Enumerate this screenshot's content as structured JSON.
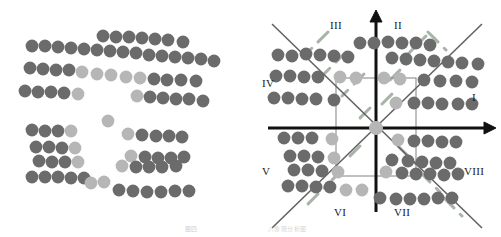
{
  "figure": {
    "title_caption": "图四",
    "subtitle_caption": "八象限分析图",
    "dot_colors": {
      "dark": "#6b6b6b",
      "light": "#b6b6b6"
    },
    "line_colors": {
      "axis": "#111111",
      "diagonal": "#6b6b6b",
      "dashed": "#9aa89a",
      "box": "#808080"
    }
  },
  "panels": [
    {
      "name": "left-scatter",
      "label": "Unlabeled dot cluster scatter",
      "dots": [
        {
          "x": 32,
          "y": 46,
          "c": "dark"
        },
        {
          "x": 45,
          "y": 46,
          "c": "dark"
        },
        {
          "x": 58,
          "y": 47,
          "c": "dark"
        },
        {
          "x": 71,
          "y": 48,
          "c": "dark"
        },
        {
          "x": 84,
          "y": 49,
          "c": "dark"
        },
        {
          "x": 97,
          "y": 50,
          "c": "dark"
        },
        {
          "x": 110,
          "y": 51,
          "c": "dark"
        },
        {
          "x": 123,
          "y": 52,
          "c": "dark"
        },
        {
          "x": 103,
          "y": 36,
          "c": "dark"
        },
        {
          "x": 116,
          "y": 37,
          "c": "dark"
        },
        {
          "x": 129,
          "y": 37,
          "c": "dark"
        },
        {
          "x": 142,
          "y": 38,
          "c": "dark"
        },
        {
          "x": 155,
          "y": 39,
          "c": "dark"
        },
        {
          "x": 168,
          "y": 40,
          "c": "dark"
        },
        {
          "x": 183,
          "y": 42,
          "c": "dark"
        },
        {
          "x": 136,
          "y": 53,
          "c": "dark"
        },
        {
          "x": 149,
          "y": 55,
          "c": "dark"
        },
        {
          "x": 162,
          "y": 56,
          "c": "dark"
        },
        {
          "x": 175,
          "y": 57,
          "c": "dark"
        },
        {
          "x": 188,
          "y": 58,
          "c": "dark"
        },
        {
          "x": 201,
          "y": 59,
          "c": "dark"
        },
        {
          "x": 214,
          "y": 61,
          "c": "dark"
        },
        {
          "x": 30,
          "y": 68,
          "c": "dark"
        },
        {
          "x": 43,
          "y": 69,
          "c": "dark"
        },
        {
          "x": 56,
          "y": 70,
          "c": "dark"
        },
        {
          "x": 69,
          "y": 70,
          "c": "dark"
        },
        {
          "x": 82,
          "y": 72,
          "c": "light"
        },
        {
          "x": 97,
          "y": 74,
          "c": "light"
        },
        {
          "x": 111,
          "y": 75,
          "c": "light"
        },
        {
          "x": 126,
          "y": 77,
          "c": "light"
        },
        {
          "x": 140,
          "y": 78,
          "c": "light"
        },
        {
          "x": 154,
          "y": 79,
          "c": "dark"
        },
        {
          "x": 167,
          "y": 80,
          "c": "dark"
        },
        {
          "x": 181,
          "y": 80,
          "c": "dark"
        },
        {
          "x": 196,
          "y": 81,
          "c": "dark"
        },
        {
          "x": 25,
          "y": 91,
          "c": "dark"
        },
        {
          "x": 38,
          "y": 92,
          "c": "dark"
        },
        {
          "x": 51,
          "y": 92,
          "c": "dark"
        },
        {
          "x": 64,
          "y": 93,
          "c": "dark"
        },
        {
          "x": 78,
          "y": 94,
          "c": "light"
        },
        {
          "x": 137,
          "y": 96,
          "c": "light"
        },
        {
          "x": 150,
          "y": 97,
          "c": "dark"
        },
        {
          "x": 163,
          "y": 98,
          "c": "dark"
        },
        {
          "x": 176,
          "y": 99,
          "c": "dark"
        },
        {
          "x": 189,
          "y": 99,
          "c": "dark"
        },
        {
          "x": 203,
          "y": 101,
          "c": "dark"
        },
        {
          "x": 108,
          "y": 121,
          "c": "light"
        },
        {
          "x": 32,
          "y": 130,
          "c": "dark"
        },
        {
          "x": 45,
          "y": 131,
          "c": "dark"
        },
        {
          "x": 58,
          "y": 131,
          "c": "dark"
        },
        {
          "x": 71,
          "y": 131,
          "c": "light"
        },
        {
          "x": 36,
          "y": 147,
          "c": "dark"
        },
        {
          "x": 49,
          "y": 147,
          "c": "dark"
        },
        {
          "x": 62,
          "y": 148,
          "c": "dark"
        },
        {
          "x": 75,
          "y": 148,
          "c": "light"
        },
        {
          "x": 128,
          "y": 134,
          "c": "light"
        },
        {
          "x": 142,
          "y": 135,
          "c": "dark"
        },
        {
          "x": 156,
          "y": 136,
          "c": "dark"
        },
        {
          "x": 169,
          "y": 136,
          "c": "dark"
        },
        {
          "x": 182,
          "y": 137,
          "c": "dark"
        },
        {
          "x": 39,
          "y": 161,
          "c": "dark"
        },
        {
          "x": 52,
          "y": 162,
          "c": "dark"
        },
        {
          "x": 65,
          "y": 162,
          "c": "dark"
        },
        {
          "x": 78,
          "y": 162,
          "c": "light"
        },
        {
          "x": 131,
          "y": 156,
          "c": "light"
        },
        {
          "x": 145,
          "y": 157,
          "c": "dark"
        },
        {
          "x": 158,
          "y": 158,
          "c": "dark"
        },
        {
          "x": 171,
          "y": 158,
          "c": "dark"
        },
        {
          "x": 184,
          "y": 157,
          "c": "dark"
        },
        {
          "x": 122,
          "y": 166,
          "c": "light"
        },
        {
          "x": 136,
          "y": 167,
          "c": "dark"
        },
        {
          "x": 149,
          "y": 167,
          "c": "dark"
        },
        {
          "x": 162,
          "y": 167,
          "c": "dark"
        },
        {
          "x": 176,
          "y": 166,
          "c": "dark"
        },
        {
          "x": 32,
          "y": 177,
          "c": "dark"
        },
        {
          "x": 45,
          "y": 177,
          "c": "dark"
        },
        {
          "x": 58,
          "y": 177,
          "c": "dark"
        },
        {
          "x": 71,
          "y": 178,
          "c": "dark"
        },
        {
          "x": 84,
          "y": 178,
          "c": "dark"
        },
        {
          "x": 91,
          "y": 183,
          "c": "light"
        },
        {
          "x": 104,
          "y": 182,
          "c": "light"
        },
        {
          "x": 119,
          "y": 190,
          "c": "dark"
        },
        {
          "x": 133,
          "y": 191,
          "c": "dark"
        },
        {
          "x": 147,
          "y": 192,
          "c": "dark"
        },
        {
          "x": 161,
          "y": 192,
          "c": "dark"
        },
        {
          "x": 175,
          "y": 191,
          "c": "dark"
        },
        {
          "x": 189,
          "y": 191,
          "c": "dark"
        }
      ]
    },
    {
      "name": "right-octant-diagram",
      "label": "Eight-octant partitioned scatter diagram",
      "axes": {
        "x_axis": {
          "from": [
            18,
            128
          ],
          "to": [
            238,
            128
          ]
        },
        "y_axis": {
          "from": [
            126,
            212
          ],
          "to": [
            126,
            16
          ]
        }
      },
      "quadrant_labels": [
        {
          "id": "I",
          "text": "I",
          "x": 222,
          "y": 92
        },
        {
          "id": "II",
          "text": "II",
          "x": 144,
          "y": 20
        },
        {
          "id": "III",
          "text": "III",
          "x": 80,
          "y": 20
        },
        {
          "id": "IV",
          "text": "IV",
          "x": 12,
          "y": 78
        },
        {
          "id": "V",
          "text": "V",
          "x": 12,
          "y": 166
        },
        {
          "id": "VI",
          "text": "VI",
          "x": 84,
          "y": 207
        },
        {
          "id": "VII",
          "text": "VII",
          "x": 144,
          "y": 207
        },
        {
          "id": "VIII",
          "text": "VIII",
          "x": 214,
          "y": 166
        }
      ],
      "dots": [
        {
          "x": 28,
          "y": 55,
          "c": "dark"
        },
        {
          "x": 42,
          "y": 56,
          "c": "dark"
        },
        {
          "x": 56,
          "y": 54,
          "c": "dark"
        },
        {
          "x": 70,
          "y": 55,
          "c": "dark"
        },
        {
          "x": 84,
          "y": 56,
          "c": "dark"
        },
        {
          "x": 98,
          "y": 57,
          "c": "dark"
        },
        {
          "x": 110,
          "y": 43,
          "c": "dark"
        },
        {
          "x": 124,
          "y": 43,
          "c": "dark"
        },
        {
          "x": 138,
          "y": 42,
          "c": "dark"
        },
        {
          "x": 152,
          "y": 43,
          "c": "dark"
        },
        {
          "x": 166,
          "y": 43,
          "c": "dark"
        },
        {
          "x": 180,
          "y": 45,
          "c": "dark"
        },
        {
          "x": 142,
          "y": 58,
          "c": "dark"
        },
        {
          "x": 156,
          "y": 59,
          "c": "dark"
        },
        {
          "x": 170,
          "y": 60,
          "c": "dark"
        },
        {
          "x": 184,
          "y": 61,
          "c": "dark"
        },
        {
          "x": 198,
          "y": 62,
          "c": "dark"
        },
        {
          "x": 212,
          "y": 63,
          "c": "dark"
        },
        {
          "x": 228,
          "y": 64,
          "c": "dark"
        },
        {
          "x": 26,
          "y": 76,
          "c": "dark"
        },
        {
          "x": 40,
          "y": 76,
          "c": "dark"
        },
        {
          "x": 54,
          "y": 77,
          "c": "dark"
        },
        {
          "x": 68,
          "y": 77,
          "c": "dark"
        },
        {
          "x": 90,
          "y": 77,
          "c": "light"
        },
        {
          "x": 106,
          "y": 78,
          "c": "light"
        },
        {
          "x": 134,
          "y": 78,
          "c": "light"
        },
        {
          "x": 150,
          "y": 79,
          "c": "light"
        },
        {
          "x": 174,
          "y": 80,
          "c": "dark"
        },
        {
          "x": 190,
          "y": 81,
          "c": "dark"
        },
        {
          "x": 206,
          "y": 81,
          "c": "dark"
        },
        {
          "x": 222,
          "y": 82,
          "c": "dark"
        },
        {
          "x": 24,
          "y": 98,
          "c": "dark"
        },
        {
          "x": 38,
          "y": 98,
          "c": "dark"
        },
        {
          "x": 52,
          "y": 99,
          "c": "dark"
        },
        {
          "x": 66,
          "y": 99,
          "c": "dark"
        },
        {
          "x": 84,
          "y": 100,
          "c": "dark"
        },
        {
          "x": 146,
          "y": 103,
          "c": "light"
        },
        {
          "x": 164,
          "y": 103,
          "c": "dark"
        },
        {
          "x": 178,
          "y": 103,
          "c": "dark"
        },
        {
          "x": 192,
          "y": 104,
          "c": "dark"
        },
        {
          "x": 208,
          "y": 104,
          "c": "dark"
        },
        {
          "x": 222,
          "y": 104,
          "c": "dark"
        },
        {
          "x": 126,
          "y": 128,
          "c": "light"
        },
        {
          "x": 34,
          "y": 138,
          "c": "dark"
        },
        {
          "x": 48,
          "y": 138,
          "c": "dark"
        },
        {
          "x": 62,
          "y": 138,
          "c": "dark"
        },
        {
          "x": 82,
          "y": 139,
          "c": "light"
        },
        {
          "x": 148,
          "y": 140,
          "c": "light"
        },
        {
          "x": 164,
          "y": 141,
          "c": "dark"
        },
        {
          "x": 178,
          "y": 141,
          "c": "dark"
        },
        {
          "x": 192,
          "y": 142,
          "c": "dark"
        },
        {
          "x": 206,
          "y": 142,
          "c": "dark"
        },
        {
          "x": 40,
          "y": 156,
          "c": "dark"
        },
        {
          "x": 54,
          "y": 156,
          "c": "dark"
        },
        {
          "x": 68,
          "y": 157,
          "c": "dark"
        },
        {
          "x": 84,
          "y": 158,
          "c": "light"
        },
        {
          "x": 142,
          "y": 160,
          "c": "dark"
        },
        {
          "x": 158,
          "y": 161,
          "c": "dark"
        },
        {
          "x": 172,
          "y": 162,
          "c": "dark"
        },
        {
          "x": 186,
          "y": 163,
          "c": "dark"
        },
        {
          "x": 200,
          "y": 163,
          "c": "dark"
        },
        {
          "x": 44,
          "y": 170,
          "c": "dark"
        },
        {
          "x": 58,
          "y": 170,
          "c": "dark"
        },
        {
          "x": 72,
          "y": 171,
          "c": "dark"
        },
        {
          "x": 88,
          "y": 172,
          "c": "light"
        },
        {
          "x": 136,
          "y": 172,
          "c": "light"
        },
        {
          "x": 152,
          "y": 173,
          "c": "dark"
        },
        {
          "x": 166,
          "y": 174,
          "c": "dark"
        },
        {
          "x": 180,
          "y": 174,
          "c": "dark"
        },
        {
          "x": 194,
          "y": 175,
          "c": "dark"
        },
        {
          "x": 208,
          "y": 174,
          "c": "dark"
        },
        {
          "x": 38,
          "y": 186,
          "c": "dark"
        },
        {
          "x": 52,
          "y": 186,
          "c": "dark"
        },
        {
          "x": 66,
          "y": 187,
          "c": "dark"
        },
        {
          "x": 80,
          "y": 187,
          "c": "dark"
        },
        {
          "x": 96,
          "y": 190,
          "c": "light"
        },
        {
          "x": 112,
          "y": 190,
          "c": "light"
        },
        {
          "x": 130,
          "y": 198,
          "c": "dark"
        },
        {
          "x": 146,
          "y": 199,
          "c": "dark"
        },
        {
          "x": 160,
          "y": 199,
          "c": "dark"
        },
        {
          "x": 174,
          "y": 199,
          "c": "dark"
        },
        {
          "x": 188,
          "y": 198,
          "c": "dark"
        },
        {
          "x": 202,
          "y": 198,
          "c": "dark"
        }
      ]
    }
  ]
}
